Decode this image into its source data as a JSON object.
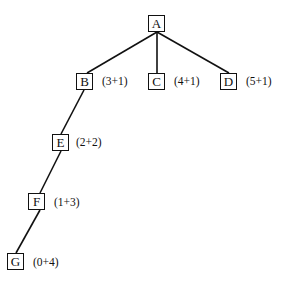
{
  "diagram": {
    "type": "tree",
    "nodes": [
      {
        "id": "A",
        "label": "A",
        "cost": "",
        "x": 148,
        "y": 15
      },
      {
        "id": "B",
        "label": "B",
        "cost": "(3+1)",
        "x": 76,
        "y": 73
      },
      {
        "id": "C",
        "label": "C",
        "cost": "(4+1)",
        "x": 148,
        "y": 73
      },
      {
        "id": "D",
        "label": "D",
        "cost": "(5+1)",
        "x": 220,
        "y": 73
      },
      {
        "id": "E",
        "label": "E",
        "cost": "(2+2)",
        "x": 52,
        "y": 134
      },
      {
        "id": "F",
        "label": "F",
        "cost": "(1+3)",
        "x": 28,
        "y": 193
      },
      {
        "id": "G",
        "label": "G",
        "cost": "(0+4)",
        "x": 7,
        "y": 253
      }
    ],
    "edges": [
      {
        "from": "A",
        "to": "B"
      },
      {
        "from": "A",
        "to": "C"
      },
      {
        "from": "A",
        "to": "D"
      },
      {
        "from": "B",
        "to": "E"
      },
      {
        "from": "E",
        "to": "F"
      },
      {
        "from": "F",
        "to": "G"
      }
    ]
  }
}
